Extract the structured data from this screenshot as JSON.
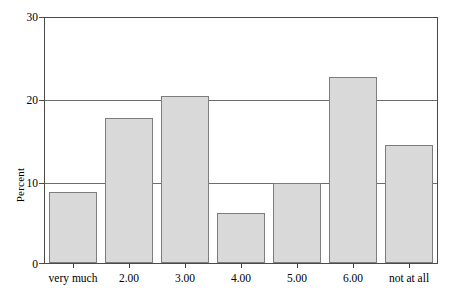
{
  "chart_data": {
    "type": "bar",
    "title": "",
    "xlabel": "",
    "ylabel": "Percent",
    "categories": [
      "very much",
      "2.00",
      "3.00",
      "4.00",
      "5.00",
      "6.00",
      "not at all"
    ],
    "values": [
      8.7,
      17.8,
      20.4,
      6.1,
      9.8,
      22.8,
      14.4
    ],
    "ylim": [
      0,
      30
    ],
    "yticks": [
      0,
      10,
      20,
      30
    ],
    "ytick_labels": [
      "0",
      "10",
      "20",
      "30"
    ],
    "grid": "horizontal",
    "legend": "none",
    "series": [
      {
        "name": "Percent",
        "values": [
          8.7,
          17.8,
          20.4,
          6.1,
          9.8,
          22.8,
          14.4
        ]
      }
    ]
  },
  "style": {
    "bar_fill": "#d9d9d9",
    "bar_stroke": "#7d7d7d",
    "frame_color": "#4a4a4a",
    "gridline_color": "#6d6d6d",
    "background": "#ffffff",
    "text_color": "#000000"
  }
}
